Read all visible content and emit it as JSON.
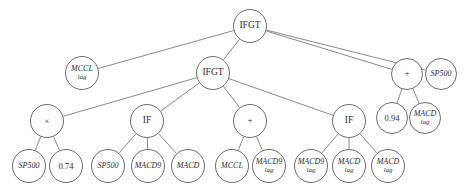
{
  "figure": {
    "kind": "expression-tree",
    "width": 473,
    "height": 194,
    "background_color": "#ffffff",
    "node_stroke_color": "#6b6b73",
    "edge_stroke_color": "#6b6b73",
    "text_color": "#2b2b2f"
  },
  "nodes": [
    {
      "id": "n0",
      "label": "IFGT",
      "sublabel": "",
      "kind": "func",
      "cx": 250,
      "cy": 26,
      "r": 17,
      "font_size": 9.5,
      "sub_font_size": 0
    },
    {
      "id": "n1",
      "label": "MCCL",
      "sublabel": "lag",
      "kind": "term",
      "cx": 82,
      "cy": 73,
      "r": 17,
      "font_size": 8,
      "sub_font_size": 7
    },
    {
      "id": "n2",
      "label": "IFGT",
      "sublabel": "",
      "kind": "func",
      "cx": 213,
      "cy": 73,
      "r": 17,
      "font_size": 9.5,
      "sub_font_size": 0
    },
    {
      "id": "n3",
      "label": "+",
      "sublabel": "",
      "kind": "op",
      "cx": 407,
      "cy": 74,
      "r": 16,
      "font_size": 9,
      "sub_font_size": 0
    },
    {
      "id": "n4",
      "label": "SP500",
      "sublabel": "",
      "kind": "term",
      "cx": 441,
      "cy": 74,
      "r": 16,
      "font_size": 8,
      "sub_font_size": 0
    },
    {
      "id": "n5",
      "label": "0.94",
      "sublabel": "",
      "kind": "op",
      "cx": 392,
      "cy": 118,
      "r": 16,
      "font_size": 8.5,
      "sub_font_size": 0
    },
    {
      "id": "n6",
      "label": "MACD",
      "sublabel": "lag",
      "kind": "term",
      "cx": 425,
      "cy": 118,
      "r": 16,
      "font_size": 8,
      "sub_font_size": 7
    },
    {
      "id": "n7",
      "label": "×",
      "sublabel": "",
      "kind": "op",
      "cx": 47,
      "cy": 121,
      "r": 17,
      "font_size": 8.5,
      "sub_font_size": 0
    },
    {
      "id": "n8",
      "label": "IF",
      "sublabel": "",
      "kind": "func",
      "cx": 147,
      "cy": 121,
      "r": 17,
      "font_size": 9.5,
      "sub_font_size": 0
    },
    {
      "id": "n9",
      "label": "+",
      "sublabel": "",
      "kind": "op",
      "cx": 250,
      "cy": 121,
      "r": 17,
      "font_size": 9,
      "sub_font_size": 0
    },
    {
      "id": "n10",
      "label": "IF",
      "sublabel": "",
      "kind": "func",
      "cx": 349,
      "cy": 121,
      "r": 17,
      "font_size": 9.5,
      "sub_font_size": 0
    },
    {
      "id": "n11",
      "label": "SP500",
      "sublabel": "",
      "kind": "term",
      "cx": 29,
      "cy": 166,
      "r": 17,
      "font_size": 8,
      "sub_font_size": 0
    },
    {
      "id": "n12",
      "label": "0.74",
      "sublabel": "",
      "kind": "op",
      "cx": 66,
      "cy": 166,
      "r": 17,
      "font_size": 8.5,
      "sub_font_size": 0
    },
    {
      "id": "n13",
      "label": "SP500",
      "sublabel": "",
      "kind": "term",
      "cx": 108,
      "cy": 166,
      "r": 17,
      "font_size": 8,
      "sub_font_size": 0
    },
    {
      "id": "n14",
      "label": "MACD9",
      "sublabel": "",
      "kind": "term",
      "cx": 148,
      "cy": 166,
      "r": 17,
      "font_size": 8,
      "sub_font_size": 0
    },
    {
      "id": "n15",
      "label": "MACD",
      "sublabel": "",
      "kind": "term",
      "cx": 188,
      "cy": 166,
      "r": 17,
      "font_size": 8,
      "sub_font_size": 0
    },
    {
      "id": "n16",
      "label": "MCCL",
      "sublabel": "",
      "kind": "term",
      "cx": 232,
      "cy": 166,
      "r": 17,
      "font_size": 8,
      "sub_font_size": 0
    },
    {
      "id": "n17",
      "label": "MACD9",
      "sublabel": "lag",
      "kind": "term",
      "cx": 269,
      "cy": 166,
      "r": 17,
      "font_size": 8,
      "sub_font_size": 7
    },
    {
      "id": "n18",
      "label": "MACD9",
      "sublabel": "lag",
      "kind": "term",
      "cx": 311,
      "cy": 166,
      "r": 17,
      "font_size": 8,
      "sub_font_size": 7
    },
    {
      "id": "n19",
      "label": "MACD",
      "sublabel": "lag",
      "kind": "term",
      "cx": 349,
      "cy": 166,
      "r": 17,
      "font_size": 8,
      "sub_font_size": 7
    },
    {
      "id": "n20",
      "label": "MACD",
      "sublabel": "lag",
      "kind": "term",
      "cx": 388,
      "cy": 166,
      "r": 17,
      "font_size": 8,
      "sub_font_size": 7
    }
  ],
  "edges": [
    {
      "from": "n0",
      "to": "n1"
    },
    {
      "from": "n0",
      "to": "n2"
    },
    {
      "from": "n0",
      "to": "n3"
    },
    {
      "from": "n0",
      "to": "n4"
    },
    {
      "from": "n2",
      "to": "n7"
    },
    {
      "from": "n2",
      "to": "n8"
    },
    {
      "from": "n2",
      "to": "n9"
    },
    {
      "from": "n2",
      "to": "n10"
    },
    {
      "from": "n3",
      "to": "n5"
    },
    {
      "from": "n3",
      "to": "n6"
    },
    {
      "from": "n7",
      "to": "n11"
    },
    {
      "from": "n7",
      "to": "n12"
    },
    {
      "from": "n8",
      "to": "n13"
    },
    {
      "from": "n8",
      "to": "n14"
    },
    {
      "from": "n8",
      "to": "n15"
    },
    {
      "from": "n9",
      "to": "n16"
    },
    {
      "from": "n9",
      "to": "n17"
    },
    {
      "from": "n10",
      "to": "n18"
    },
    {
      "from": "n10",
      "to": "n19"
    },
    {
      "from": "n10",
      "to": "n20"
    }
  ]
}
